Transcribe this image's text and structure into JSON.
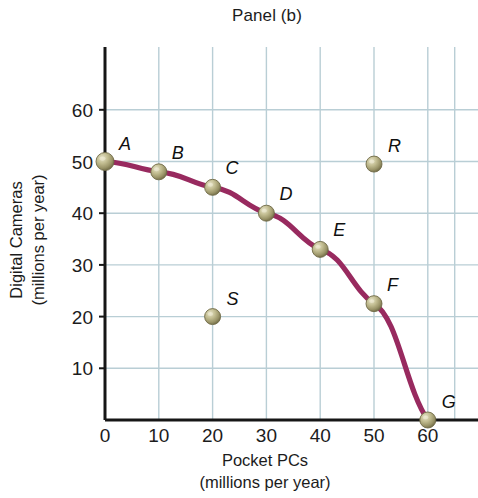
{
  "chart_data": {
    "type": "line",
    "title": "Panel (b)",
    "xlabel": "Pocket PCs",
    "xlabel_units": "(millions per year)",
    "ylabel": "Digital Cameras",
    "ylabel_units": "(millions per year)",
    "xlim": [
      0,
      68
    ],
    "ylim": [
      0,
      65
    ],
    "xticks": [
      0,
      10,
      20,
      30,
      40,
      50,
      60
    ],
    "xtick_labels": [
      "0",
      "10",
      "20",
      "30",
      "40",
      "50",
      "60"
    ],
    "yticks": [
      10,
      20,
      30,
      40,
      50,
      60
    ],
    "ytick_labels": [
      "10",
      "20",
      "30",
      "40",
      "50",
      "60"
    ],
    "grid": true,
    "grid_color": "#b9ced5",
    "line_color": "#982a5f",
    "marker_color": "#a8a274",
    "axis_color": "#161616",
    "legend": null,
    "series": [
      {
        "name": "Production possibilities frontier",
        "curve_color": "#982a5f",
        "points": [
          {
            "label": "A",
            "x": 0,
            "y": 50,
            "label_dx": 14,
            "label_dy": -12
          },
          {
            "label": "B",
            "x": 10,
            "y": 48,
            "label_dx": 13,
            "label_dy": -13
          },
          {
            "label": "C",
            "x": 20,
            "y": 45,
            "label_dx": 13,
            "label_dy": -13
          },
          {
            "label": "D",
            "x": 30,
            "y": 40,
            "label_dx": 13,
            "label_dy": -13
          },
          {
            "label": "E",
            "x": 40,
            "y": 33,
            "label_dx": 13,
            "label_dy": -13
          },
          {
            "label": "F",
            "x": 50,
            "y": 22.5,
            "label_dx": 13,
            "label_dy": -13
          },
          {
            "label": "G",
            "x": 60,
            "y": 0,
            "label_dx": 14,
            "label_dy": -12
          }
        ]
      }
    ],
    "extra_points": [
      {
        "label": "R",
        "x": 50,
        "y": 49.5,
        "label_dx": 14,
        "label_dy": -12
      },
      {
        "label": "S",
        "x": 20,
        "y": 20,
        "label_dx": 14,
        "label_dy": -12
      }
    ]
  },
  "axes": {
    "x_axis_pixel_origin": 105,
    "y_axis_pixel_origin": 420,
    "x_pixels_per_unit": 5.38,
    "y_pixels_per_unit": 5.17
  }
}
